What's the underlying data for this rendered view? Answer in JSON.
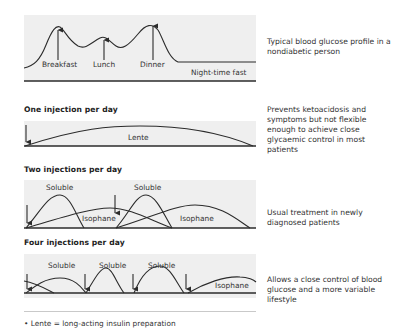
{
  "panels": [
    {
      "id": "nondiabetic",
      "heading": "",
      "description": "Typical blood glucose profile in a nondiabetic person",
      "labels": [
        "Breakfast",
        "Lunch",
        "Dinner",
        "Night-time fast"
      ]
    },
    {
      "id": "one-injection",
      "heading": "One injection per day",
      "description": "Prevents ketoacidosis and symptoms but not flexible enough to achieve close glycaemic control in most patients",
      "labels": [
        "Lente"
      ]
    },
    {
      "id": "two-injections",
      "heading": "Two injections per day",
      "description": "Usual treatment in newly diagnosed patients",
      "labels": [
        "Soluble",
        "Soluble",
        "Isophane",
        "Isophane"
      ]
    },
    {
      "id": "four-injections",
      "heading": "Four injections per day",
      "description": "Allows a close control of blood glucose and a more variable lifestyle",
      "labels": [
        "Soluble",
        "Soluble",
        "Soluble",
        "Isophane"
      ]
    }
  ],
  "footnote": "• Lente = long-acting insulin preparation",
  "colors": {
    "panel": "#efefef",
    "line": "#2b2b2b",
    "text": "#333333"
  }
}
